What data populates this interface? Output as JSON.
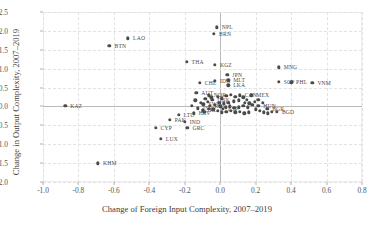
{
  "chart_data": {
    "type": "scatter",
    "title": "",
    "xlabel": "Change of Foreign Input Complexity, 2007–2019",
    "ylabel": "Change in Output Complexity, 2007–2019",
    "xlim": [
      -1.0,
      0.8
    ],
    "ylim": [
      -2.0,
      2.5
    ],
    "xticks": [
      "-1.0",
      "-0.8",
      "-0.6",
      "-0.4",
      "-0.2",
      "0.0",
      "0.2",
      "0.4",
      "0.6",
      "0.8"
    ],
    "xtick_values": [
      -1.0,
      -0.8,
      -0.6,
      -0.4,
      -0.2,
      0.0,
      0.2,
      0.4,
      0.6,
      0.8
    ],
    "yticks": [
      "2.5",
      "2.0",
      "1.5",
      "1.0",
      "0.5",
      "0.0",
      "-0.5",
      "-1.0",
      "-1.5",
      "-2.0"
    ],
    "ytick_values": [
      2.5,
      2.0,
      1.5,
      1.0,
      0.5,
      0.0,
      -0.5,
      -1.0,
      -1.5,
      -2.0
    ],
    "grid": true,
    "legend": "none",
    "marker_color": "#4a4a4a",
    "grid_color": "#e2e2e2",
    "zero_line_color": "#b9b9b9",
    "points": [
      {
        "label": "KAZ",
        "x": -0.875,
        "y": 0.02,
        "lx": 5,
        "ly": 0
      },
      {
        "label": "BTN",
        "x": -0.625,
        "y": 1.6,
        "lx": 5,
        "ly": 0
      },
      {
        "label": "LAO",
        "x": -0.52,
        "y": 1.8,
        "lx": 5,
        "ly": 0
      },
      {
        "label": "KHM",
        "x": -0.69,
        "y": -1.5,
        "lx": 5,
        "ly": 0
      },
      {
        "label": "CYP",
        "x": -0.365,
        "y": -0.56,
        "lx": 5,
        "ly": 0
      },
      {
        "label": "LUX",
        "x": -0.335,
        "y": -0.86,
        "lx": 5,
        "ly": 0
      },
      {
        "label": "PAK",
        "x": -0.285,
        "y": -0.35,
        "lx": 5,
        "ly": 0
      },
      {
        "label": "GRC",
        "x": -0.185,
        "y": -0.57,
        "lx": 5,
        "ly": 0
      },
      {
        "label": "IND",
        "x": -0.2,
        "y": -0.4,
        "lx": 5,
        "ly": 0
      },
      {
        "label": "LTU",
        "x": -0.235,
        "y": -0.22,
        "lx": 5,
        "ly": 0
      },
      {
        "label": "HRV",
        "x": -0.15,
        "y": -0.18,
        "lx": 5,
        "ly": 0
      },
      {
        "label": "THA",
        "x": -0.19,
        "y": 1.18,
        "lx": 5,
        "ly": 0
      },
      {
        "label": "CHE",
        "x": -0.115,
        "y": 0.62,
        "lx": 5,
        "ly": 0
      },
      {
        "label": "AUT",
        "x": -0.135,
        "y": 0.36,
        "lx": 5,
        "ly": 0
      },
      {
        "label": "NPL",
        "x": -0.02,
        "y": 2.1,
        "lx": 5,
        "ly": 0
      },
      {
        "label": "BRN",
        "x": -0.035,
        "y": 1.93,
        "lx": 5,
        "ly": 0
      },
      {
        "label": "KGZ",
        "x": -0.03,
        "y": 1.1,
        "lx": 5,
        "ly": 0
      },
      {
        "label": "IDN",
        "x": -0.03,
        "y": 0.68,
        "lx": 5,
        "ly": 0
      },
      {
        "label": "JPN",
        "x": 0.04,
        "y": 0.84,
        "lx": 5,
        "ly": 0
      },
      {
        "label": "MLT",
        "x": 0.045,
        "y": 0.69,
        "lx": 5,
        "ly": 0
      },
      {
        "label": "LKA",
        "x": 0.045,
        "y": 0.56,
        "lx": 5,
        "ly": 0
      },
      {
        "label": "MNG",
        "x": 0.33,
        "y": 1.04,
        "lx": 5,
        "ly": 0
      },
      {
        "label": "SGP",
        "x": 0.33,
        "y": 0.66,
        "lx": 5,
        "ly": 0
      },
      {
        "label": "PHL",
        "x": 0.4,
        "y": 0.64,
        "lx": 5,
        "ly": 0
      },
      {
        "label": "VNM",
        "x": 0.52,
        "y": 0.62,
        "lx": 5,
        "ly": 0
      },
      {
        "label": "NOR",
        "x": -0.065,
        "y": 0.3,
        "lx": 5,
        "ly": 0
      },
      {
        "label": "DNK",
        "x": -0.045,
        "y": 0.18,
        "lx": 5,
        "ly": 0
      },
      {
        "label": "SWE",
        "x": -0.095,
        "y": 0.06,
        "lx": 5,
        "ly": 0
      },
      {
        "label": "RUS",
        "x": -0.06,
        "y": 0.02,
        "lx": 5,
        "ly": 0
      },
      {
        "label": "IRL",
        "x": -0.1,
        "y": -0.1,
        "lx": 5,
        "ly": 0
      },
      {
        "label": "ISR",
        "x": -0.125,
        "y": -0.05,
        "lx": 5,
        "ly": 0
      },
      {
        "label": "ESP",
        "x": 0.015,
        "y": -0.06,
        "lx": 5,
        "ly": 0
      },
      {
        "label": "CAN",
        "x": 0.11,
        "y": 0.3,
        "lx": 5,
        "ly": 0
      },
      {
        "label": "MEX",
        "x": 0.175,
        "y": 0.3,
        "lx": 5,
        "ly": 0
      },
      {
        "label": "HUN",
        "x": 0.215,
        "y": 0.02,
        "lx": 5,
        "ly": 0
      },
      {
        "label": "BGR",
        "x": 0.265,
        "y": -0.06,
        "lx": 5,
        "ly": 0
      },
      {
        "label": "BGD",
        "x": 0.32,
        "y": -0.14,
        "lx": 5,
        "ly": 0
      },
      {
        "label": "",
        "x": -0.07,
        "y": 0.12,
        "lx": 0,
        "ly": 0
      },
      {
        "label": "",
        "x": -0.085,
        "y": 0.2,
        "lx": 0,
        "ly": 0
      },
      {
        "label": "",
        "x": -0.05,
        "y": 0.24,
        "lx": 0,
        "ly": 0
      },
      {
        "label": "",
        "x": -0.015,
        "y": 0.26,
        "lx": 0,
        "ly": 0
      },
      {
        "label": "",
        "x": 0.01,
        "y": 0.22,
        "lx": 0,
        "ly": 0
      },
      {
        "label": "",
        "x": 0.035,
        "y": 0.28,
        "lx": 0,
        "ly": 0
      },
      {
        "label": "",
        "x": 0.06,
        "y": 0.31,
        "lx": 0,
        "ly": 0
      },
      {
        "label": "",
        "x": 0.085,
        "y": 0.26,
        "lx": 0,
        "ly": 0
      },
      {
        "label": "",
        "x": 0.13,
        "y": 0.24,
        "lx": 0,
        "ly": 0
      },
      {
        "label": "",
        "x": 0.15,
        "y": 0.18,
        "lx": 0,
        "ly": 0
      },
      {
        "label": "",
        "x": 0.105,
        "y": 0.16,
        "lx": 0,
        "ly": 0
      },
      {
        "label": "",
        "x": 0.075,
        "y": 0.14,
        "lx": 0,
        "ly": 0
      },
      {
        "label": "",
        "x": 0.045,
        "y": 0.1,
        "lx": 0,
        "ly": 0
      },
      {
        "label": "",
        "x": 0.02,
        "y": 0.08,
        "lx": 0,
        "ly": 0
      },
      {
        "label": "",
        "x": -0.005,
        "y": 0.1,
        "lx": 0,
        "ly": 0
      },
      {
        "label": "",
        "x": -0.03,
        "y": 0.05,
        "lx": 0,
        "ly": 0
      },
      {
        "label": "",
        "x": 0.0,
        "y": 0.0,
        "lx": 0,
        "ly": 0
      },
      {
        "label": "",
        "x": 0.03,
        "y": -0.02,
        "lx": 0,
        "ly": 0
      },
      {
        "label": "",
        "x": 0.055,
        "y": 0.0,
        "lx": 0,
        "ly": 0
      },
      {
        "label": "",
        "x": 0.08,
        "y": -0.04,
        "lx": 0,
        "ly": 0
      },
      {
        "label": "",
        "x": 0.105,
        "y": -0.02,
        "lx": 0,
        "ly": 0
      },
      {
        "label": "",
        "x": 0.13,
        "y": 0.02,
        "lx": 0,
        "ly": 0
      },
      {
        "label": "",
        "x": 0.155,
        "y": -0.02,
        "lx": 0,
        "ly": 0
      },
      {
        "label": "",
        "x": 0.18,
        "y": 0.04,
        "lx": 0,
        "ly": 0
      },
      {
        "label": "",
        "x": 0.2,
        "y": -0.08,
        "lx": 0,
        "ly": 0
      },
      {
        "label": "",
        "x": 0.225,
        "y": -0.12,
        "lx": 0,
        "ly": 0
      },
      {
        "label": "",
        "x": 0.245,
        "y": -0.16,
        "lx": 0,
        "ly": 0
      },
      {
        "label": "",
        "x": 0.27,
        "y": -0.18,
        "lx": 0,
        "ly": 0
      },
      {
        "label": "",
        "x": 0.29,
        "y": -0.14,
        "lx": 0,
        "ly": 0
      },
      {
        "label": "",
        "x": 0.16,
        "y": -0.16,
        "lx": 0,
        "ly": 0
      },
      {
        "label": "",
        "x": 0.135,
        "y": -0.18,
        "lx": 0,
        "ly": 0
      },
      {
        "label": "",
        "x": 0.11,
        "y": -0.14,
        "lx": 0,
        "ly": 0
      },
      {
        "label": "",
        "x": 0.085,
        "y": -0.16,
        "lx": 0,
        "ly": 0
      },
      {
        "label": "",
        "x": 0.06,
        "y": -0.12,
        "lx": 0,
        "ly": 0
      },
      {
        "label": "",
        "x": 0.035,
        "y": -0.14,
        "lx": 0,
        "ly": 0
      },
      {
        "label": "",
        "x": 0.01,
        "y": -0.16,
        "lx": 0,
        "ly": 0
      },
      {
        "label": "",
        "x": -0.015,
        "y": -0.12,
        "lx": 0,
        "ly": 0
      },
      {
        "label": "",
        "x": -0.04,
        "y": -0.08,
        "lx": 0,
        "ly": 0
      },
      {
        "label": "",
        "x": -0.065,
        "y": -0.06,
        "lx": 0,
        "ly": 0
      },
      {
        "label": "",
        "x": -0.09,
        "y": -0.14,
        "lx": 0,
        "ly": 0
      },
      {
        "label": "",
        "x": -0.11,
        "y": 0.1,
        "lx": 0,
        "ly": 0
      },
      {
        "label": "",
        "x": -0.14,
        "y": 0.16,
        "lx": 0,
        "ly": 0
      },
      {
        "label": "",
        "x": -0.16,
        "y": 0.02,
        "lx": 0,
        "ly": 0
      },
      {
        "label": "",
        "x": 0.195,
        "y": 0.12,
        "lx": 0,
        "ly": 0
      },
      {
        "label": "",
        "x": 0.215,
        "y": 0.18,
        "lx": 0,
        "ly": 0
      },
      {
        "label": "",
        "x": 0.24,
        "y": 0.1,
        "lx": 0,
        "ly": 0
      },
      {
        "label": "",
        "x": 0.165,
        "y": 0.08,
        "lx": 0,
        "ly": 0
      },
      {
        "label": "",
        "x": 0.14,
        "y": 0.1,
        "lx": 0,
        "ly": 0
      }
    ]
  }
}
